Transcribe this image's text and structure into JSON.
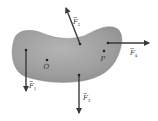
{
  "diagram": {
    "colors": {
      "body_fill": "#9a9a9a",
      "body_fill_light": "#bdbdbd",
      "arrow": "#3a3a3a",
      "text": "#333333",
      "background": "#ffffff"
    },
    "points": [
      {
        "id": "O",
        "label": "O",
        "x": 47,
        "y": 60
      },
      {
        "id": "P",
        "label": "P",
        "x": 104,
        "y": 51
      }
    ],
    "forces": [
      {
        "id": "F1",
        "symbol": "F",
        "subscript": "1",
        "from": [
          26,
          50
        ],
        "to": [
          26,
          92
        ]
      },
      {
        "id": "F2",
        "symbol": "F",
        "subscript": "2",
        "from": [
          80,
          44
        ],
        "to": [
          65,
          6
        ]
      },
      {
        "id": "F3",
        "symbol": "F",
        "subscript": "3",
        "from": [
          79,
          75
        ],
        "to": [
          79,
          114
        ]
      },
      {
        "id": "F4",
        "symbol": "F",
        "subscript": "4",
        "from": [
          108,
          43
        ],
        "to": [
          150,
          43
        ]
      }
    ]
  }
}
